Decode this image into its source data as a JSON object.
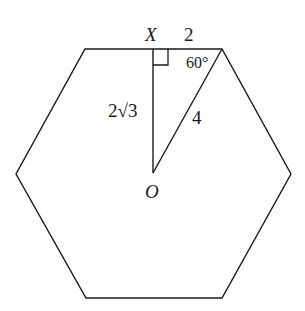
{
  "diagram": {
    "type": "geometry",
    "shape": "regular-hexagon",
    "colors": {
      "stroke": "#1a1a1a",
      "background": "#fefefe"
    },
    "vertices": [
      {
        "x": 85,
        "y": 49
      },
      {
        "x": 222,
        "y": 49
      },
      {
        "x": 291,
        "y": 174
      },
      {
        "x": 222,
        "y": 298
      },
      {
        "x": 86,
        "y": 298
      },
      {
        "x": 16,
        "y": 174
      }
    ],
    "points": {
      "X": {
        "label": "X",
        "x": 153,
        "y": 49
      },
      "O": {
        "label": "O",
        "x": 153,
        "y": 173
      },
      "V": {
        "x": 222,
        "y": 49
      }
    },
    "labels": {
      "x_point": "X",
      "o_point": "O",
      "half_side": "2",
      "apothem": "2√3",
      "radius": "4",
      "angle": "60°"
    },
    "segments": [
      {
        "name": "apothem-OX",
        "label": "2√3"
      },
      {
        "name": "radius-OV",
        "label": "4"
      },
      {
        "name": "half-side-XV",
        "label": "2"
      }
    ],
    "right_angle_at": "X",
    "angle_at_vertex": "60°"
  }
}
